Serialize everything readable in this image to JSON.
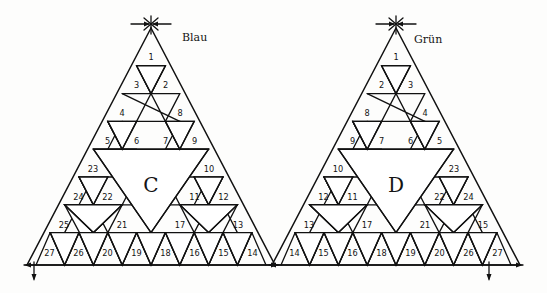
{
  "figure": {
    "background": "#fdfdfc",
    "ink_color": "#141414"
  },
  "triangles": [
    {
      "id": "C",
      "letter": "C",
      "color_label": "Blau",
      "apex_marker": "arrows-in",
      "base_axis": true,
      "rows": {
        "row1": [
          "1"
        ],
        "row2": [
          "3",
          "2"
        ],
        "row3": [
          "4",
          "8"
        ],
        "row4": [
          "5",
          "6",
          "7",
          "9"
        ],
        "row5": [
          "23",
          "10"
        ],
        "row6": [
          "24",
          "22",
          "11",
          "12"
        ],
        "row7": [
          "25",
          "21",
          "17",
          "13"
        ],
        "row8": [
          "27",
          "26",
          "20",
          "19",
          "18",
          "16",
          "15",
          "14"
        ]
      },
      "cells": [
        {
          "n": "1",
          "x": 151.0,
          "y": 55.0,
          "up": true
        },
        {
          "n": "3",
          "x": 136.5,
          "y": 83.0,
          "up": true
        },
        {
          "n": "2",
          "x": 165.5,
          "y": 83.0,
          "up": true
        },
        {
          "n": "4",
          "x": 122.0,
          "y": 111.0,
          "up": true
        },
        {
          "n": "8",
          "x": 180.0,
          "y": 111.0,
          "up": true
        },
        {
          "n": "5",
          "x": 107.5,
          "y": 139.0,
          "up": true
        },
        {
          "n": "6",
          "x": 136.5,
          "y": 139.0,
          "up": true
        },
        {
          "n": "7",
          "x": 165.5,
          "y": 139.0,
          "up": true
        },
        {
          "n": "9",
          "x": 194.5,
          "y": 139.0,
          "up": true
        },
        {
          "n": "23",
          "x": 93.0,
          "y": 167.0,
          "up": true
        },
        {
          "n": "10",
          "x": 209.0,
          "y": 167.0,
          "up": true
        },
        {
          "n": "24",
          "x": 78.5,
          "y": 195.0,
          "up": true
        },
        {
          "n": "22",
          "x": 107.5,
          "y": 195.0,
          "up": true
        },
        {
          "n": "11",
          "x": 194.5,
          "y": 195.0,
          "up": true
        },
        {
          "n": "12",
          "x": 223.5,
          "y": 195.0,
          "up": true
        },
        {
          "n": "25",
          "x": 64.0,
          "y": 223.0,
          "up": true
        },
        {
          "n": "21",
          "x": 122.0,
          "y": 223.0,
          "up": true
        },
        {
          "n": "17",
          "x": 180.0,
          "y": 223.0,
          "up": true
        },
        {
          "n": "13",
          "x": 238.0,
          "y": 223.0,
          "up": true
        },
        {
          "n": "27",
          "x": 49.5,
          "y": 251.0,
          "up": true
        },
        {
          "n": "26",
          "x": 78.5,
          "y": 251.0,
          "up": true
        },
        {
          "n": "20",
          "x": 107.5,
          "y": 251.0,
          "up": true
        },
        {
          "n": "19",
          "x": 136.5,
          "y": 251.0,
          "up": true
        },
        {
          "n": "18",
          "x": 165.5,
          "y": 251.0,
          "up": true
        },
        {
          "n": "16",
          "x": 194.5,
          "y": 251.0,
          "up": true
        },
        {
          "n": "15",
          "x": 223.5,
          "y": 251.0,
          "up": true
        },
        {
          "n": "14",
          "x": 252.5,
          "y": 251.0,
          "up": true
        }
      ]
    },
    {
      "id": "D",
      "letter": "D",
      "color_label": "Grün",
      "apex_marker": "arrows-in",
      "base_axis": true,
      "rows": {
        "row1": [
          "1"
        ],
        "row2": [
          "2",
          "3"
        ],
        "row3": [
          "8",
          "4"
        ],
        "row4": [
          "9",
          "7",
          "6",
          "5"
        ],
        "row5": [
          "10",
          "23"
        ],
        "row6": [
          "12",
          "11",
          "22",
          "24"
        ],
        "row7": [
          "13",
          "17",
          "21",
          "15"
        ],
        "row8": [
          "14",
          "15",
          "16",
          "18",
          "19",
          "20",
          "26",
          "27"
        ]
      },
      "cells": [
        {
          "n": "1",
          "x": 396.0,
          "y": 55.0,
          "up": true
        },
        {
          "n": "2",
          "x": 381.5,
          "y": 83.0,
          "up": true
        },
        {
          "n": "3",
          "x": 410.5,
          "y": 83.0,
          "up": true
        },
        {
          "n": "8",
          "x": 367.0,
          "y": 111.0,
          "up": true
        },
        {
          "n": "4",
          "x": 425.0,
          "y": 111.0,
          "up": true
        },
        {
          "n": "9",
          "x": 352.5,
          "y": 139.0,
          "up": true
        },
        {
          "n": "7",
          "x": 381.5,
          "y": 139.0,
          "up": true
        },
        {
          "n": "6",
          "x": 410.5,
          "y": 139.0,
          "up": true
        },
        {
          "n": "5",
          "x": 439.5,
          "y": 139.0,
          "up": true
        },
        {
          "n": "10",
          "x": 338.0,
          "y": 167.0,
          "up": true
        },
        {
          "n": "23",
          "x": 454.0,
          "y": 167.0,
          "up": true
        },
        {
          "n": "12",
          "x": 323.5,
          "y": 195.0,
          "up": true
        },
        {
          "n": "11",
          "x": 352.5,
          "y": 195.0,
          "up": true
        },
        {
          "n": "22",
          "x": 439.5,
          "y": 195.0,
          "up": true
        },
        {
          "n": "24",
          "x": 468.5,
          "y": 195.0,
          "up": true
        },
        {
          "n": "13",
          "x": 309.0,
          "y": 223.0,
          "up": true
        },
        {
          "n": "17",
          "x": 367.0,
          "y": 223.0,
          "up": true
        },
        {
          "n": "21",
          "x": 425.0,
          "y": 223.0,
          "up": true
        },
        {
          "n": "15",
          "x": 483.0,
          "y": 223.0,
          "up": true
        },
        {
          "n": "14",
          "x": 294.5,
          "y": 251.0,
          "up": true
        },
        {
          "n": "15",
          "x": 323.5,
          "y": 251.0,
          "up": true
        },
        {
          "n": "16",
          "x": 352.5,
          "y": 251.0,
          "up": true
        },
        {
          "n": "18",
          "x": 381.5,
          "y": 251.0,
          "up": true
        },
        {
          "n": "19",
          "x": 410.5,
          "y": 251.0,
          "up": true
        },
        {
          "n": "20",
          "x": 439.5,
          "y": 251.0,
          "up": true
        },
        {
          "n": "26",
          "x": 468.5,
          "y": 251.0,
          "up": true
        },
        {
          "n": "27",
          "x": 497.5,
          "y": 251.0,
          "up": true
        }
      ]
    }
  ],
  "annotations": {
    "left_color_label": "Blau",
    "right_color_label": "Grün",
    "left_letter": "C",
    "right_letter": "D"
  }
}
